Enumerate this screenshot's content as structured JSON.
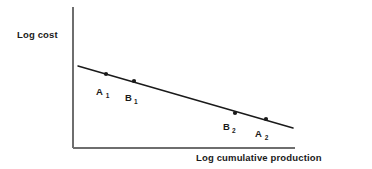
{
  "figure": {
    "background_color": "#ffffff",
    "line_color": "#1a1a1a",
    "axis_color": "#6e6e6e",
    "ylabel": "Log cost",
    "xlabel": "Log cumulative production"
  },
  "chart_data": {
    "type": "scatter",
    "title": "",
    "subtitle": "",
    "xlabel": "Log cumulative production",
    "ylabel": "Log cost",
    "grid": false,
    "legend": false,
    "axis_style": "schematic",
    "tick_labels": {
      "x": [],
      "y": []
    },
    "series": [
      {
        "name": "Experience curve",
        "type": "line",
        "points": [
          {
            "x": 78,
            "y": 66
          },
          {
            "x": 293,
            "y": 128
          }
        ]
      },
      {
        "name": "Observations",
        "type": "scatter",
        "points": [
          {
            "label": "A",
            "subscript": "1",
            "x": 106,
            "y": 74,
            "label_x": 96,
            "label_y": 95,
            "sub_dx": 9.4,
            "sub_dy": 2.6
          },
          {
            "label": "B",
            "subscript": "1",
            "x": 134,
            "y": 81,
            "label_x": 125,
            "label_y": 101,
            "sub_dx": 8.8,
            "sub_dy": 2.6
          },
          {
            "label": "B",
            "subscript": "2",
            "x": 235,
            "y": 113,
            "label_x": 223,
            "label_y": 130,
            "sub_dx": 8.8,
            "sub_dy": 2.6
          },
          {
            "label": "A",
            "subscript": "2",
            "x": 266,
            "y": 119,
            "label_x": 255,
            "label_y": 137,
            "sub_dx": 9.4,
            "sub_dy": 2.6
          }
        ]
      }
    ],
    "axes": {
      "y_axis": {
        "x": 73,
        "y_top": 7,
        "y_bottom": 148
      },
      "x_axis": {
        "y": 148,
        "x_left": 73,
        "x_right": 295
      }
    },
    "label_positions": {
      "ylabel": {
        "x": 17,
        "y": 38
      },
      "xlabel": {
        "x": 196,
        "y": 161
      }
    }
  }
}
